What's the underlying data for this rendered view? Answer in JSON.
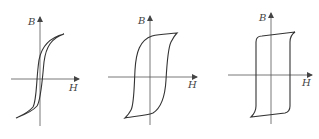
{
  "figure": {
    "panels": [
      {
        "id": "soft",
        "y_label": "B",
        "x_label": "H",
        "loop_shape": "narrow S-shaped loop"
      },
      {
        "id": "medium",
        "y_label": "B",
        "x_label": "H",
        "loop_shape": "wide rounded loop"
      },
      {
        "id": "hard",
        "y_label": "B",
        "x_label": "H",
        "loop_shape": "rectangular loop"
      }
    ],
    "colors": {
      "line": "#333333",
      "axis": "#555555",
      "background": "#ffffff"
    }
  }
}
